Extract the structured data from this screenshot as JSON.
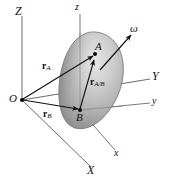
{
  "figure": {
    "background_color": "#ffffff",
    "line_color": "#4a4a4a",
    "vector_color": "#1a1a1a",
    "body_fill_light": "#d8d8d8",
    "body_fill_dark": "#8d8d8d",
    "body_outline": "#6b6b6b",
    "axes": {
      "Z": "Z",
      "z": "z",
      "Y": "Y",
      "y": "y",
      "X": "X",
      "x": "x"
    },
    "points": {
      "origin": "O",
      "A": "A",
      "B": "B"
    },
    "vectors": {
      "r_A": {
        "symbol": "r",
        "subscript": "A"
      },
      "r_B": {
        "symbol": "r",
        "subscript": "B"
      },
      "r_A_over_B": {
        "symbol": "r",
        "subscript": "A/B"
      }
    },
    "angular_velocity": "ω"
  }
}
